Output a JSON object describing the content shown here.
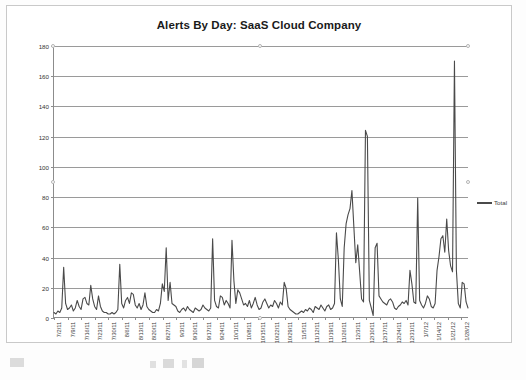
{
  "document": {
    "kind": "scanned-chart-page"
  },
  "legend": {
    "series_label": "Total",
    "position": "right"
  },
  "colors": {
    "series_line": "#4a4a4a",
    "gridline": "#9a9a9a",
    "axis": "#8c8c8c",
    "frame": "#c9c9c9",
    "title_text": "#1a1a1a"
  },
  "chart_data": {
    "type": "line",
    "title": "Alerts By Day:  SaaS Cloud Company",
    "xlabel": "",
    "ylabel": "",
    "ylim": [
      0,
      180
    ],
    "ytick_labels": [
      "0",
      "20",
      "40",
      "60",
      "80",
      "100",
      "120",
      "140",
      "160",
      "180"
    ],
    "yticks": [
      0,
      20,
      40,
      60,
      80,
      100,
      120,
      140,
      160,
      180
    ],
    "grid": true,
    "legend_position": "right",
    "xtick_labels": [
      "7/2/11",
      "7/9/11",
      "7/16/11",
      "7/23/11",
      "7/30/11",
      "8/6/11",
      "8/13/11",
      "8/20/11",
      "8/27/11",
      "9/3/11",
      "9/10/11",
      "9/17/11",
      "9/24/11",
      "10/1/11",
      "10/8/11",
      "10/15/11",
      "10/22/11",
      "10/29/11",
      "11/5/11",
      "11/12/11",
      "11/19/11",
      "11/26/11",
      "12/3/11",
      "12/10/11",
      "12/17/11",
      "12/24/11",
      "12/31/11",
      "1/7/12",
      "1/14/12",
      "1/21/12",
      "1/28/12"
    ],
    "xtick_interval_days": 7,
    "x_start": "7/2/11",
    "x_end": "2/3/12",
    "series": [
      {
        "name": "Total",
        "values": [
          3,
          2,
          4,
          3,
          6,
          33,
          9,
          5,
          6,
          8,
          4,
          6,
          11,
          7,
          5,
          12,
          13,
          9,
          8,
          21,
          12,
          7,
          5,
          14,
          7,
          4,
          3,
          3,
          2,
          2,
          3,
          2,
          3,
          5,
          35,
          9,
          6,
          11,
          13,
          9,
          16,
          15,
          8,
          6,
          9,
          5,
          8,
          16,
          7,
          5,
          4,
          3,
          3,
          5,
          4,
          9,
          22,
          17,
          46,
          11,
          23,
          9,
          8,
          7,
          4,
          3,
          5,
          6,
          4,
          7,
          5,
          4,
          3,
          6,
          5,
          4,
          5,
          8,
          6,
          5,
          4,
          6,
          52,
          11,
          7,
          6,
          14,
          13,
          8,
          11,
          9,
          6,
          51,
          24,
          9,
          18,
          16,
          12,
          8,
          9,
          7,
          11,
          6,
          9,
          13,
          8,
          5,
          6,
          10,
          12,
          9,
          6,
          8,
          7,
          11,
          9,
          6,
          10,
          8,
          23,
          19,
          7,
          5,
          4,
          3,
          2,
          2,
          3,
          4,
          3,
          5,
          4,
          6,
          5,
          3,
          7,
          6,
          5,
          8,
          6,
          4,
          7,
          8,
          5,
          6,
          9,
          56,
          38,
          12,
          7,
          46,
          62,
          68,
          72,
          84,
          60,
          36,
          48,
          30,
          12,
          10,
          124,
          120,
          11,
          6,
          1,
          46,
          49,
          14,
          12,
          10,
          9,
          8,
          11,
          12,
          10,
          6,
          5,
          7,
          8,
          10,
          9,
          11,
          8,
          31,
          22,
          10,
          9,
          79,
          11,
          8,
          6,
          9,
          14,
          12,
          7,
          6,
          9,
          31,
          40,
          52,
          54,
          43,
          65,
          44,
          34,
          30,
          170,
          31,
          9,
          6,
          23,
          22,
          10,
          6
        ]
      }
    ],
    "annotations": {
      "max_value": 170,
      "secondary_peaks": [
        124,
        120,
        84,
        79,
        72,
        68,
        65,
        62,
        56,
        54,
        52,
        51,
        46
      ]
    }
  }
}
